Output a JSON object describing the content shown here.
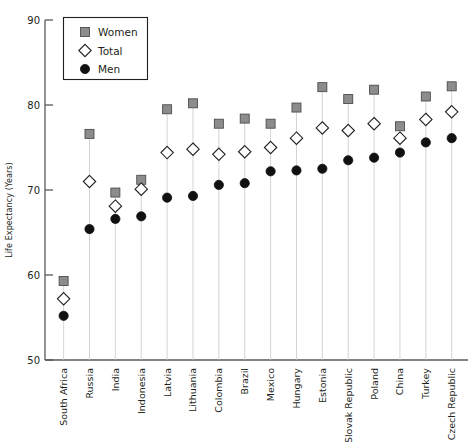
{
  "chart_data": {
    "type": "scatter",
    "title": "",
    "xlabel": "",
    "ylabel": "Life Expectancy (Years)",
    "ylim": [
      50,
      90
    ],
    "yticks": [
      50,
      60,
      70,
      80,
      90
    ],
    "grid": "vertical-stems",
    "legend_position": "top-left-inside",
    "categories": [
      "South Africa",
      "Russia",
      "India",
      "Indonesia",
      "Latvia",
      "Lithuania",
      "Colombia",
      "Brazil",
      "Mexico",
      "Hungary",
      "Estonia",
      "Slovak Republic",
      "Poland",
      "China",
      "Turkey",
      "Czech Republic"
    ],
    "series": [
      {
        "name": "Women",
        "marker": "filled-square-gray",
        "color": "#8c8c8c",
        "values": [
          59.3,
          76.6,
          69.7,
          71.2,
          79.5,
          80.2,
          77.8,
          78.4,
          77.8,
          79.7,
          82.1,
          80.7,
          81.8,
          77.5,
          81.0,
          82.2
        ]
      },
      {
        "name": "Total",
        "marker": "open-diamond",
        "color": "#ffffff",
        "values": [
          57.2,
          71.0,
          68.1,
          70.1,
          74.4,
          74.8,
          74.2,
          74.5,
          75.0,
          76.1,
          77.3,
          77.0,
          77.8,
          76.1,
          78.3,
          79.2
        ]
      },
      {
        "name": "Men",
        "marker": "filled-circle-black",
        "color": "#111111",
        "values": [
          55.2,
          65.4,
          66.6,
          66.9,
          69.1,
          69.3,
          70.6,
          70.8,
          72.2,
          72.3,
          72.5,
          73.5,
          73.8,
          74.4,
          75.6,
          76.1
        ]
      }
    ],
    "legend_entries": [
      {
        "label": "Women",
        "marker": "filled-square-gray"
      },
      {
        "label": "Total",
        "marker": "open-diamond"
      },
      {
        "label": "Men",
        "marker": "filled-circle-black"
      }
    ],
    "colors": {
      "women": "#8c8c8c",
      "women_border": "#4d4d4d",
      "total": "#ffffff",
      "total_border": "#231f20",
      "men": "#111111",
      "axis": "#58595b",
      "stem": "#c9c9c9",
      "text": "#231f20"
    }
  }
}
